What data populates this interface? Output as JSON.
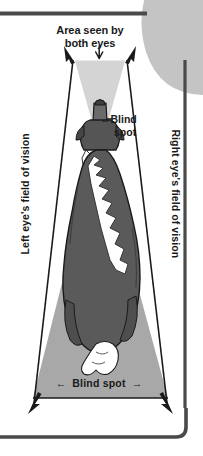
{
  "figure": {
    "type": "diagram",
    "labels": {
      "binocular_line1": "Area seen by",
      "binocular_line2": "both eyes",
      "blind_spot_top_arrow": "←",
      "blind_spot_top_line1": "Blind",
      "blind_spot_top_line2": "spot",
      "blind_spot_bottom": "Blind spot",
      "blind_spot_bottom_arrow_left": "←",
      "blind_spot_bottom_arrow_right": "→",
      "left_eye_field": "Left eye's field of vision",
      "right_eye_field": "Right eye's field of vision",
      "binocular_down_arrow": "↓"
    },
    "colors": {
      "page_background": "#ffffff",
      "peripheral_cone": "#a8a8a8",
      "binocular_cone": "#d4d4d4",
      "dog_body": "#5a5a5a",
      "dog_fur_white": "#ffffff",
      "outline": "#1a1a1a",
      "frame_rule": "#4a4a4a",
      "corner_shape": "#c4c4c4",
      "text": "#1a1a1a"
    }
  }
}
